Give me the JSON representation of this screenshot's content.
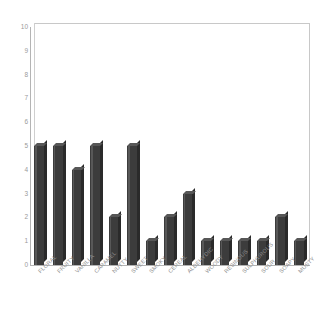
{
  "chart_data": {
    "type": "bar",
    "title": "",
    "subtitle": "",
    "xlabel": "",
    "ylabel": "",
    "categories": [
      "FLORAL",
      "FRUITY",
      "VANILLA",
      "CARAMEL",
      "NUTTY",
      "SWEET",
      "SMOKY",
      "CEREAL",
      "ALDEHYDIC",
      "WOODY",
      "RESINOUS",
      "SULPHUROUS",
      "SOUR",
      "SOAPY",
      "MUSTY"
    ],
    "values": [
      5,
      5,
      4,
      5,
      2,
      5,
      1,
      2,
      3,
      1,
      1,
      1,
      1,
      2,
      1
    ],
    "ylim": [
      0,
      10
    ],
    "ytick_values": [
      0,
      1,
      2,
      3,
      4,
      5,
      6,
      7,
      8,
      9,
      10
    ],
    "ytick_labels": [
      "0",
      "1",
      "2",
      "3",
      "4",
      "5",
      "6",
      "7",
      "8",
      "9",
      "10"
    ],
    "grid": false,
    "legend": null,
    "legend_position": "none",
    "annotations": [],
    "style": {
      "bar_color": "#3c3c3c",
      "bar_side_color": "#2a2a2a",
      "bar_top_color": "#575757",
      "background_color": "#ffffff",
      "axis_color": "#b4b4b4",
      "plot_border_color": "#c8c8c8",
      "tick_label_color": "#9a9a9a",
      "category_label_color": "#8e8e8e",
      "three_d": true,
      "label_rotation_degrees": -45
    }
  }
}
